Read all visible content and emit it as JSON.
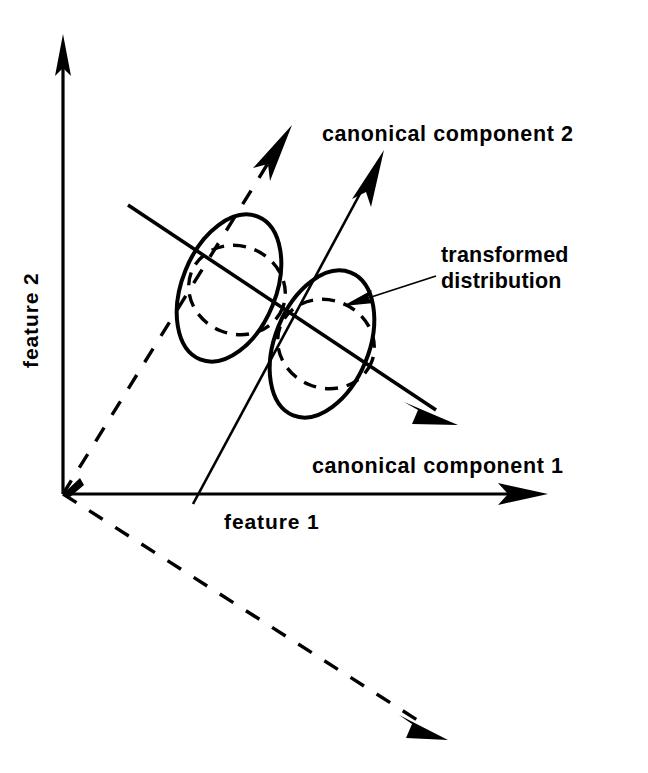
{
  "figure": {
    "background_color": "#ffffff",
    "ink_color": "#000000",
    "width": 648,
    "height": 773
  },
  "axes": {
    "x_label": "feature 1",
    "y_label": "feature 2",
    "origin": {
      "x": 63,
      "y": 494
    },
    "x_end": {
      "x": 545,
      "y": 494
    },
    "y_end": {
      "x": 63,
      "y": 38
    }
  },
  "canonical_axes": [
    {
      "name": "canonical-component-1",
      "label": "canonical component 1",
      "style": "solid",
      "start": {
        "x": 128,
        "y": 205
      },
      "end": {
        "x": 455,
        "y": 423
      },
      "label_position": {
        "x": 312,
        "y": 466
      }
    },
    {
      "name": "canonical-component-2",
      "label": "canonical component 2",
      "style": "solid",
      "start": {
        "x": 193,
        "y": 504
      },
      "end": {
        "x": 382,
        "y": 153
      },
      "label_position": {
        "x": 322,
        "y": 134
      }
    }
  ],
  "dashed_axes": [
    {
      "name": "dashed-axis-upper",
      "style": "dashed",
      "start": {
        "x": 63,
        "y": 494
      },
      "end": {
        "x": 290,
        "y": 128
      }
    },
    {
      "name": "dashed-axis-lower",
      "style": "dashed",
      "start": {
        "x": 63,
        "y": 494
      },
      "end": {
        "x": 445,
        "y": 738
      }
    }
  ],
  "distributions": [
    {
      "name": "original-distribution-left",
      "style": "solid",
      "center": {
        "x": 229,
        "y": 288
      },
      "rx": 47,
      "ry": 77,
      "rotation_deg": 22
    },
    {
      "name": "original-distribution-right",
      "style": "solid",
      "center": {
        "x": 322,
        "y": 344
      },
      "rx": 47,
      "ry": 77,
      "rotation_deg": 22
    },
    {
      "name": "transformed-distribution-left",
      "style": "dashed",
      "center": {
        "x": 237,
        "y": 290
      },
      "rx": 49,
      "ry": 44,
      "rotation_deg": 22
    },
    {
      "name": "transformed-distribution-right",
      "style": "dashed",
      "center": {
        "x": 326,
        "y": 344
      },
      "rx": 49,
      "ry": 44,
      "rotation_deg": 22
    }
  ],
  "callout": {
    "label_line_1": "transformed",
    "label_line_2": "distribution",
    "label_position": {
      "x": 440,
      "y": 262
    },
    "pointer_start": {
      "x": 432,
      "y": 276
    },
    "pointer_end": {
      "x": 345,
      "y": 305
    }
  }
}
